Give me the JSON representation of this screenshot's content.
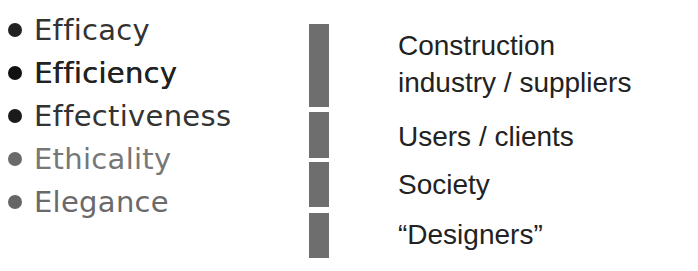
{
  "criteria": [
    {
      "label": "Efficacy",
      "color": "#333333",
      "bullet_color": "#222222",
      "bold": false
    },
    {
      "label": "Efficiency",
      "color": "#222222",
      "bullet_color": "#111111",
      "bold": true
    },
    {
      "label": "Effectiveness",
      "color": "#333333",
      "bullet_color": "#1a1a1a",
      "bold": false
    },
    {
      "label": "Ethicality",
      "color": "#777777",
      "bullet_color": "#6a6a6a",
      "bold": false
    },
    {
      "label": "Elegance",
      "color": "#6a6a6a",
      "bullet_color": "#666666",
      "bold": false
    }
  ],
  "bars": [
    {
      "top": 24,
      "height": 83
    },
    {
      "top": 112,
      "height": 46
    },
    {
      "top": 162,
      "height": 45
    },
    {
      "top": 213,
      "height": 45
    }
  ],
  "stakeholders": [
    {
      "line1": "Construction",
      "line2": "industry / suppliers"
    },
    {
      "line1": "Users / clients"
    },
    {
      "line1": "Society"
    },
    {
      "line1": "“Designers”"
    }
  ]
}
